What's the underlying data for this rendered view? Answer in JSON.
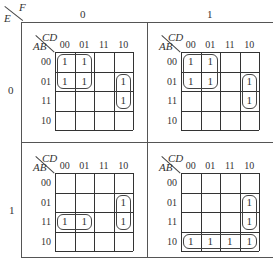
{
  "outer": {
    "row_var": "E",
    "col_var": "F",
    "col_labels": [
      "0",
      "1"
    ],
    "row_labels": [
      "0",
      "1"
    ]
  },
  "inner_axes": {
    "row_var": "AB",
    "col_var": "CD",
    "col_labels": [
      "00",
      "01",
      "11",
      "10"
    ],
    "row_labels": [
      "00",
      "01",
      "11",
      "10"
    ]
  },
  "maps": [
    {
      "id": "E0F0",
      "cells": [
        [
          "1",
          "1",
          "",
          ""
        ],
        [
          "1",
          "1",
          "",
          "1"
        ],
        [
          "",
          "",
          "",
          "1"
        ],
        [
          "",
          "",
          "",
          ""
        ]
      ],
      "loops": [
        {
          "row": 0,
          "col": 0,
          "rows": 2,
          "cols": 2
        },
        {
          "row": 1,
          "col": 3,
          "rows": 2,
          "cols": 1
        }
      ]
    },
    {
      "id": "E0F1",
      "cells": [
        [
          "1",
          "1",
          "",
          ""
        ],
        [
          "1",
          "1",
          "",
          "1"
        ],
        [
          "",
          "",
          "",
          "1"
        ],
        [
          "",
          "",
          "",
          ""
        ]
      ],
      "loops": [
        {
          "row": 0,
          "col": 0,
          "rows": 2,
          "cols": 2
        },
        {
          "row": 1,
          "col": 3,
          "rows": 2,
          "cols": 1
        }
      ]
    },
    {
      "id": "E1F0",
      "cells": [
        [
          "",
          "",
          "",
          ""
        ],
        [
          "",
          "",
          "",
          "1"
        ],
        [
          "1",
          "1",
          "",
          "1"
        ],
        [
          "",
          "",
          "",
          ""
        ]
      ],
      "loops": [
        {
          "row": 1,
          "col": 3,
          "rows": 2,
          "cols": 1
        },
        {
          "row": 2,
          "col": 0,
          "rows": 1,
          "cols": 2
        }
      ]
    },
    {
      "id": "E1F1",
      "cells": [
        [
          "",
          "",
          "",
          ""
        ],
        [
          "",
          "",
          "",
          "1"
        ],
        [
          "",
          "",
          "",
          "1"
        ],
        [
          "1",
          "1",
          "1",
          "1"
        ]
      ],
      "loops": [
        {
          "row": 1,
          "col": 3,
          "rows": 2,
          "cols": 1
        },
        {
          "row": 3,
          "col": 0,
          "rows": 1,
          "cols": 4
        }
      ]
    }
  ]
}
